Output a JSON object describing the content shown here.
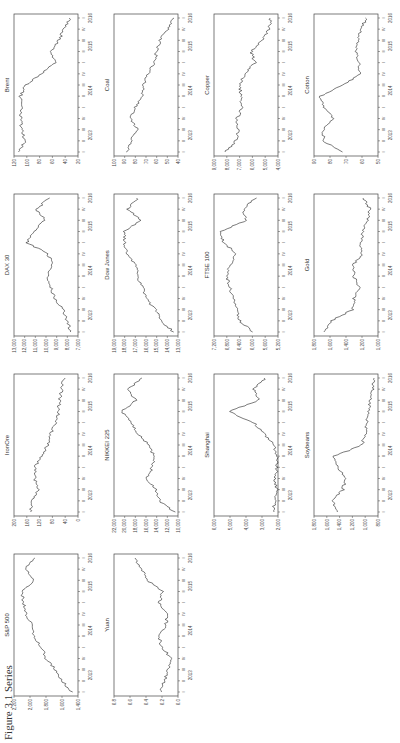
{
  "figure": {
    "caption": "Figure 3.1 Series",
    "x_ticks_quarters": [
      "I",
      "II",
      "III",
      "IV",
      "I",
      "II",
      "III",
      "IV",
      "I",
      "II",
      "III",
      "IV",
      "I"
    ],
    "x_ticks_years": [
      "2013",
      "2014",
      "2015",
      "2016"
    ]
  },
  "chart_data": [
    {
      "type": "line",
      "title": "Brent",
      "ylim": [
        20,
        120
      ],
      "yticks": [
        "120",
        "100",
        "80",
        "60",
        "40",
        "20"
      ],
      "xlabel": "",
      "ylabel": "",
      "x": [
        "2013Q1",
        "2013Q2",
        "2013Q3",
        "2013Q4",
        "2014Q1",
        "2014Q2",
        "2014Q3",
        "2014Q4",
        "2015Q1",
        "2015Q2",
        "2015Q3",
        "2015Q4",
        "2016Q1"
      ],
      "values": [
        112,
        103,
        108,
        110,
        107,
        110,
        102,
        78,
        55,
        62,
        50,
        42,
        33
      ]
    },
    {
      "type": "line",
      "title": "Coal",
      "ylim": [
        40,
        100
      ],
      "yticks": [
        "100",
        "90",
        "80",
        "70",
        "60",
        "50",
        "40"
      ],
      "x": [
        "2013Q1",
        "2013Q2",
        "2013Q3",
        "2013Q4",
        "2014Q1",
        "2014Q2",
        "2014Q3",
        "2014Q4",
        "2015Q1",
        "2015Q2",
        "2015Q3",
        "2015Q4",
        "2016Q1"
      ],
      "values": [
        88,
        84,
        78,
        84,
        80,
        74,
        72,
        68,
        62,
        60,
        57,
        50,
        45
      ]
    },
    {
      "type": "line",
      "title": "Copper",
      "ylim": [
        4000,
        9000
      ],
      "yticks": [
        "9,000",
        "8,000",
        "7,000",
        "6,000",
        "5,000",
        "4,000"
      ],
      "x": [
        "2013Q1",
        "2013Q2",
        "2013Q3",
        "2013Q4",
        "2014Q1",
        "2014Q2",
        "2014Q3",
        "2014Q4",
        "2015Q1",
        "2015Q2",
        "2015Q3",
        "2015Q4",
        "2016Q1"
      ],
      "values": [
        8100,
        7300,
        7100,
        7200,
        6800,
        6900,
        7000,
        6600,
        5800,
        6100,
        5200,
        4700,
        4600
      ]
    },
    {
      "type": "line",
      "title": "Cotton",
      "ylim": [
        50,
        90
      ],
      "yticks": [
        "90",
        "80",
        "70",
        "60",
        "50"
      ],
      "x": [
        "2013Q1",
        "2013Q2",
        "2013Q3",
        "2013Q4",
        "2014Q1",
        "2014Q2",
        "2014Q3",
        "2014Q4",
        "2015Q1",
        "2015Q2",
        "2015Q3",
        "2015Q4",
        "2016Q1"
      ],
      "values": [
        72,
        84,
        84,
        78,
        84,
        86,
        72,
        61,
        62,
        64,
        62,
        61,
        57
      ]
    },
    {
      "type": "line",
      "title": "DAX 30",
      "ylim": [
        7000,
        13000
      ],
      "yticks": [
        "13,000",
        "12,000",
        "11,000",
        "10,000",
        "9,000",
        "8,000",
        "7,000"
      ],
      "x": [
        "2013Q1",
        "2013Q2",
        "2013Q3",
        "2013Q4",
        "2014Q1",
        "2014Q2",
        "2014Q3",
        "2014Q4",
        "2015Q1",
        "2015Q2",
        "2015Q3",
        "2015Q4",
        "2016Q1"
      ],
      "values": [
        7700,
        8000,
        8400,
        9200,
        9500,
        9900,
        9400,
        9800,
        11800,
        11200,
        10100,
        10900,
        9700
      ]
    },
    {
      "type": "line",
      "title": "Dow Jones",
      "ylim": [
        13000,
        19000
      ],
      "yticks": [
        "19,000",
        "18,000",
        "17,000",
        "16,000",
        "15,000",
        "14,000",
        "13,000"
      ],
      "x": [
        "2013Q1",
        "2013Q2",
        "2013Q3",
        "2013Q4",
        "2014Q1",
        "2014Q2",
        "2014Q3",
        "2014Q4",
        "2015Q1",
        "2015Q2",
        "2015Q3",
        "2015Q4",
        "2016Q1"
      ],
      "values": [
        13400,
        14600,
        15100,
        16000,
        16300,
        16800,
        17000,
        17800,
        18000,
        18000,
        16500,
        17700,
        16800
      ]
    },
    {
      "type": "line",
      "title": "FTSE 100",
      "ylim": [
        5200,
        7200
      ],
      "yticks": [
        "7,200",
        "6,800",
        "6,400",
        "6,000",
        "5,600",
        "5,200"
      ],
      "x": [
        "2013Q1",
        "2013Q2",
        "2013Q3",
        "2013Q4",
        "2014Q1",
        "2014Q2",
        "2014Q3",
        "2014Q4",
        "2015Q1",
        "2015Q2",
        "2015Q3",
        "2015Q4",
        "2016Q1"
      ],
      "values": [
        6000,
        6400,
        6500,
        6600,
        6700,
        6800,
        6700,
        6500,
        6900,
        7000,
        6200,
        6300,
        5900
      ]
    },
    {
      "type": "line",
      "title": "Gold",
      "ylim": [
        1000,
        1800
      ],
      "yticks": [
        "1,800",
        "1,600",
        "1,400",
        "1,200",
        "1,000"
      ],
      "x": [
        "2013Q1",
        "2013Q2",
        "2013Q3",
        "2013Q4",
        "2014Q1",
        "2014Q2",
        "2014Q3",
        "2014Q4",
        "2015Q1",
        "2015Q2",
        "2015Q3",
        "2015Q4",
        "2016Q1"
      ],
      "values": [
        1680,
        1580,
        1320,
        1300,
        1240,
        1300,
        1310,
        1200,
        1210,
        1190,
        1130,
        1100,
        1180
      ]
    },
    {
      "type": "line",
      "title": "IronOre",
      "ylim": [
        0,
        200
      ],
      "yticks": [
        "200",
        "160",
        "120",
        "80",
        "40",
        "0"
      ],
      "x": [
        "2013Q1",
        "2013Q2",
        "2013Q3",
        "2013Q4",
        "2014Q1",
        "2014Q2",
        "2014Q3",
        "2014Q4",
        "2015Q1",
        "2015Q2",
        "2015Q3",
        "2015Q4",
        "2016Q1"
      ],
      "values": [
        150,
        145,
        125,
        135,
        135,
        115,
        95,
        85,
        70,
        60,
        58,
        50,
        45
      ]
    },
    {
      "type": "line",
      "title": "NIKKEI 225",
      "ylim": [
        10000,
        22000
      ],
      "yticks": [
        "22,000",
        "20,000",
        "18,000",
        "16,000",
        "14,000",
        "12,000",
        "10,000"
      ],
      "x": [
        "2013Q1",
        "2013Q2",
        "2013Q3",
        "2013Q4",
        "2014Q1",
        "2014Q2",
        "2014Q3",
        "2014Q4",
        "2015Q1",
        "2015Q2",
        "2015Q3",
        "2015Q4",
        "2016Q1"
      ],
      "values": [
        10600,
        13500,
        14200,
        15800,
        14800,
        14500,
        15500,
        17400,
        18800,
        20500,
        18000,
        19300,
        16800
      ]
    },
    {
      "type": "line",
      "title": "Shanghai",
      "ylim": [
        2000,
        6000
      ],
      "yticks": [
        "6,000",
        "5,000",
        "4,000",
        "3,000",
        "2,000"
      ],
      "x": [
        "2013Q1",
        "2013Q2",
        "2013Q3",
        "2013Q4",
        "2014Q1",
        "2014Q2",
        "2014Q3",
        "2014Q4",
        "2015Q1",
        "2015Q2",
        "2015Q3",
        "2015Q4",
        "2016Q1"
      ],
      "values": [
        2300,
        2200,
        2100,
        2200,
        2050,
        2050,
        2250,
        2900,
        3500,
        5100,
        3200,
        3500,
        2800
      ]
    },
    {
      "type": "line",
      "title": "Soybeans",
      "ylim": [
        800,
        1800
      ],
      "yticks": [
        "1,800",
        "1,600",
        "1,400",
        "1,200",
        "1,000",
        "800"
      ],
      "x": [
        "2013Q1",
        "2013Q2",
        "2013Q3",
        "2013Q4",
        "2014Q1",
        "2014Q2",
        "2014Q3",
        "2014Q4",
        "2015Q1",
        "2015Q2",
        "2015Q3",
        "2015Q4",
        "2016Q1"
      ],
      "values": [
        1450,
        1500,
        1350,
        1300,
        1420,
        1480,
        1050,
        1000,
        980,
        950,
        920,
        880,
        870
      ]
    },
    {
      "type": "line",
      "title": "S&P 500",
      "ylim": [
        1400,
        2200
      ],
      "yticks": [
        "2,200",
        "2,000",
        "1,800",
        "1,600",
        "1,400"
      ],
      "x": [
        "2013Q1",
        "2013Q2",
        "2013Q3",
        "2013Q4",
        "2014Q1",
        "2014Q2",
        "2014Q3",
        "2014Q4",
        "2015Q1",
        "2015Q2",
        "2015Q3",
        "2015Q4",
        "2016Q1"
      ],
      "values": [
        1480,
        1600,
        1680,
        1800,
        1850,
        1950,
        1980,
        2050,
        2080,
        2100,
        1950,
        2060,
        1930
      ]
    },
    {
      "type": "line",
      "title": "Yuan",
      "ylim": [
        6.0,
        6.8
      ],
      "yticks": [
        "6.8",
        "6.6",
        "6.4",
        "6.2",
        "6.0"
      ],
      "x": [
        "2013Q1",
        "2013Q2",
        "2013Q3",
        "2013Q4",
        "2014Q1",
        "2014Q2",
        "2014Q3",
        "2014Q4",
        "2015Q1",
        "2015Q2",
        "2015Q3",
        "2015Q4",
        "2016Q1"
      ],
      "values": [
        6.22,
        6.17,
        6.12,
        6.08,
        6.2,
        6.24,
        6.15,
        6.14,
        6.23,
        6.2,
        6.38,
        6.45,
        6.55
      ]
    }
  ]
}
